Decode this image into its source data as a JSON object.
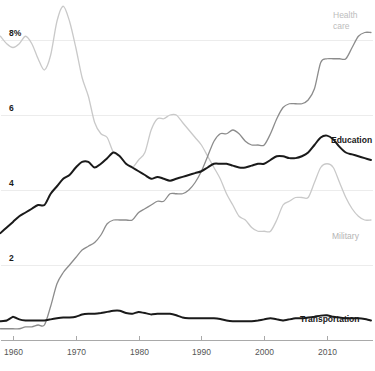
{
  "chart_data": {
    "type": "line",
    "title": "",
    "subtitle": "",
    "xlabel": "",
    "ylabel": "",
    "unit": "%",
    "xlim": [
      1958,
      2017
    ],
    "ylim": [
      0,
      9.1
    ],
    "grid": true,
    "legend_position": "inline-right",
    "x_ticks": [
      1960,
      1970,
      1980,
      1990,
      2000,
      2010
    ],
    "x_tick_labels": [
      "1960",
      "1970",
      "1980",
      "1990",
      "2000",
      "2010"
    ],
    "y_ticks": [
      2,
      4,
      6,
      8
    ],
    "y_tick_labels": [
      "2",
      "4",
      "6",
      "8%"
    ],
    "x": [
      1958,
      1959,
      1960,
      1961,
      1962,
      1963,
      1964,
      1965,
      1966,
      1967,
      1968,
      1969,
      1970,
      1971,
      1972,
      1973,
      1974,
      1975,
      1976,
      1977,
      1978,
      1979,
      1980,
      1981,
      1982,
      1983,
      1984,
      1985,
      1986,
      1987,
      1988,
      1989,
      1990,
      1991,
      1992,
      1993,
      1994,
      1995,
      1996,
      1997,
      1998,
      1999,
      2000,
      2001,
      2002,
      2003,
      2004,
      2005,
      2006,
      2007,
      2008,
      2009,
      2010,
      2011,
      2012,
      2013,
      2014,
      2015,
      2016,
      2017
    ],
    "series": [
      {
        "name": "Military",
        "label": "Military",
        "color": "#c9c9c9",
        "width": 1.3,
        "label_color": "#b4b4b4",
        "label_bold": false,
        "label_x": 332,
        "label_y": 239,
        "values": [
          8.1,
          7.9,
          7.8,
          7.9,
          8.1,
          7.9,
          7.5,
          7.2,
          7.6,
          8.5,
          8.9,
          8.5,
          7.8,
          7.0,
          6.5,
          5.8,
          5.5,
          5.4,
          5.0,
          4.9,
          4.7,
          4.6,
          4.8,
          5.0,
          5.6,
          5.9,
          5.9,
          6.0,
          6.0,
          5.8,
          5.6,
          5.4,
          5.2,
          4.9,
          4.6,
          4.3,
          3.9,
          3.6,
          3.3,
          3.2,
          3.0,
          2.9,
          2.9,
          2.9,
          3.2,
          3.6,
          3.7,
          3.8,
          3.8,
          3.8,
          4.2,
          4.6,
          4.7,
          4.6,
          4.2,
          3.8,
          3.5,
          3.3,
          3.2,
          3.2
        ]
      },
      {
        "name": "Health care",
        "label": "Health care",
        "label_line1": "Health",
        "label_line2": "care",
        "color": "#8c8c8c",
        "width": 1.3,
        "label_color": "#bdbdbd",
        "label_bold": false,
        "label_x": 333,
        "label_y": 18,
        "values": [
          0.3,
          0.3,
          0.3,
          0.3,
          0.35,
          0.35,
          0.4,
          0.4,
          0.9,
          1.5,
          1.8,
          2.0,
          2.2,
          2.4,
          2.5,
          2.6,
          2.8,
          3.1,
          3.2,
          3.2,
          3.2,
          3.2,
          3.4,
          3.5,
          3.6,
          3.7,
          3.7,
          3.9,
          3.9,
          3.9,
          4.0,
          4.2,
          4.5,
          4.9,
          5.3,
          5.5,
          5.5,
          5.6,
          5.5,
          5.3,
          5.2,
          5.2,
          5.2,
          5.5,
          5.9,
          6.2,
          6.3,
          6.3,
          6.3,
          6.4,
          6.7,
          7.4,
          7.5,
          7.5,
          7.5,
          7.5,
          7.8,
          8.1,
          8.2,
          8.2
        ]
      },
      {
        "name": "Education",
        "label": "Education",
        "color": "#1a1a1a",
        "width": 2.0,
        "label_color": "#1a1a1a",
        "label_bold": true,
        "label_x": 331,
        "label_y": 143,
        "values": [
          2.85,
          3.0,
          3.15,
          3.3,
          3.4,
          3.5,
          3.6,
          3.6,
          3.9,
          4.1,
          4.3,
          4.4,
          4.6,
          4.75,
          4.75,
          4.6,
          4.7,
          4.85,
          5.0,
          4.9,
          4.7,
          4.6,
          4.5,
          4.4,
          4.3,
          4.35,
          4.3,
          4.25,
          4.3,
          4.35,
          4.4,
          4.45,
          4.5,
          4.6,
          4.7,
          4.7,
          4.7,
          4.65,
          4.6,
          4.6,
          4.65,
          4.7,
          4.7,
          4.8,
          4.9,
          4.9,
          4.85,
          4.85,
          4.9,
          5.0,
          5.2,
          5.4,
          5.45,
          5.35,
          5.15,
          5.0,
          4.95,
          4.9,
          4.85,
          4.8
        ]
      },
      {
        "name": "Transportation",
        "label": "Transportation",
        "color": "#1a1a1a",
        "width": 2.0,
        "label_color": "#1a1a1a",
        "label_bold": true,
        "label_x": 300,
        "label_y": 322,
        "values": [
          0.5,
          0.52,
          0.62,
          0.55,
          0.52,
          0.52,
          0.52,
          0.52,
          0.55,
          0.58,
          0.6,
          0.6,
          0.62,
          0.68,
          0.7,
          0.7,
          0.72,
          0.75,
          0.78,
          0.78,
          0.72,
          0.7,
          0.75,
          0.72,
          0.68,
          0.7,
          0.7,
          0.7,
          0.66,
          0.6,
          0.58,
          0.58,
          0.58,
          0.58,
          0.58,
          0.56,
          0.52,
          0.5,
          0.5,
          0.5,
          0.5,
          0.52,
          0.55,
          0.58,
          0.55,
          0.52,
          0.55,
          0.58,
          0.58,
          0.6,
          0.62,
          0.65,
          0.66,
          0.62,
          0.6,
          0.58,
          0.58,
          0.58,
          0.56,
          0.52
        ]
      }
    ]
  },
  "axis": {
    "y_label_top": "8%",
    "y_label_6": "6",
    "y_label_4": "4",
    "y_label_2": "2"
  },
  "labels": {
    "health_line1": "Health",
    "health_line2": "care",
    "education": "Education",
    "military": "Military",
    "transportation": "Transportation"
  }
}
